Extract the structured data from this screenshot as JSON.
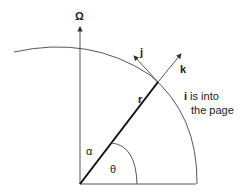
{
  "labels": {
    "omega": "Ω",
    "j": "j",
    "k": "k",
    "r": "r",
    "i": "i",
    "i_note_1": " is into",
    "i_note_2": "the page",
    "alpha": "α",
    "theta": "θ"
  },
  "colors": {
    "stroke": "#333333",
    "text": "#222222"
  }
}
